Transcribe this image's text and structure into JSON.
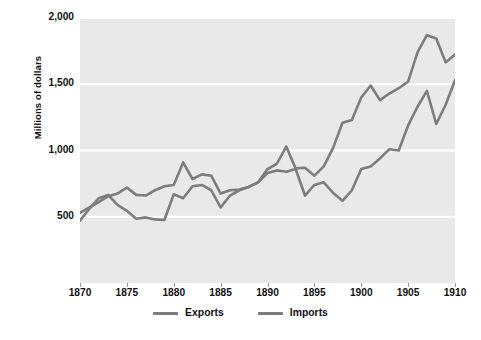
{
  "chart_data": {
    "type": "line",
    "title": "",
    "xlabel": "",
    "ylabel": "Millions of dollars",
    "xlim": [
      1870,
      1910
    ],
    "ylim": [
      0,
      2000
    ],
    "grid": true,
    "grid_color": "#ffffff",
    "plot_background": "#e9e9e9",
    "legend_position": "bottom-center",
    "xticks": [
      1870,
      1875,
      1880,
      1885,
      1890,
      1895,
      1900,
      1905,
      1910
    ],
    "xtick_labels": [
      "1870",
      "1875",
      "1880",
      "1885",
      "1890",
      "1895",
      "1900",
      "1905",
      "1910"
    ],
    "yticks": [
      500,
      1000,
      1500,
      2000
    ],
    "ytick_labels": [
      "500",
      "1,000",
      "1,500",
      "2,000"
    ],
    "x": [
      1870,
      1871,
      1872,
      1873,
      1874,
      1875,
      1876,
      1877,
      1878,
      1879,
      1880,
      1881,
      1882,
      1883,
      1884,
      1885,
      1886,
      1887,
      1888,
      1889,
      1890,
      1891,
      1892,
      1893,
      1894,
      1895,
      1896,
      1897,
      1898,
      1899,
      1900,
      1901,
      1902,
      1903,
      1904,
      1905,
      1906,
      1907,
      1908,
      1909,
      1910
    ],
    "series": [
      {
        "name": "Exports",
        "color": "#7d7d7d",
        "values": [
          530,
          570,
          610,
          655,
          675,
          720,
          665,
          660,
          700,
          730,
          740,
          910,
          785,
          820,
          810,
          675,
          700,
          705,
          725,
          760,
          860,
          900,
          1030,
          865,
          870,
          810,
          880,
          1020,
          1210,
          1230,
          1400,
          1490,
          1380,
          1430,
          1470,
          1520,
          1740,
          1870,
          1845,
          1665,
          1725
        ]
      },
      {
        "name": "Imports",
        "color": "#7d7d7d",
        "values": [
          470,
          560,
          640,
          665,
          590,
          545,
          485,
          495,
          480,
          475,
          670,
          640,
          730,
          740,
          700,
          570,
          660,
          700,
          725,
          760,
          830,
          850,
          840,
          860,
          660,
          740,
          760,
          680,
          620,
          700,
          860,
          880,
          940,
          1010,
          1000,
          1190,
          1330,
          1450,
          1200,
          1345,
          1530
        ]
      }
    ]
  },
  "legend": {
    "items": [
      {
        "label": "Exports",
        "color": "#7d7d7d"
      },
      {
        "label": "Imports",
        "color": "#7d7d7d"
      }
    ]
  },
  "showthrough": {
    "heading": "e Monroe Doctrine and the",
    "subheading": "h Policy",
    "lines": [
      "civil war in 1898 when",
      "ening of relations with Great Brit",
      "rom its own hemisphere",
      "ion between Britain and the Unit",
      "he Venezuela crisis of 1895. Brit",
      "ican nations to mediate disputes",
      "ss to a new role as hemispheric p",
      "elt Corollary to the Monroe Doct",
      "e of the Monroe Doctrine, which h",
      "pean intervention in Latin Americ",
      "o a claim of a right of interventio",
      "ng to the Roosevelt Corollary, th"
    ]
  }
}
